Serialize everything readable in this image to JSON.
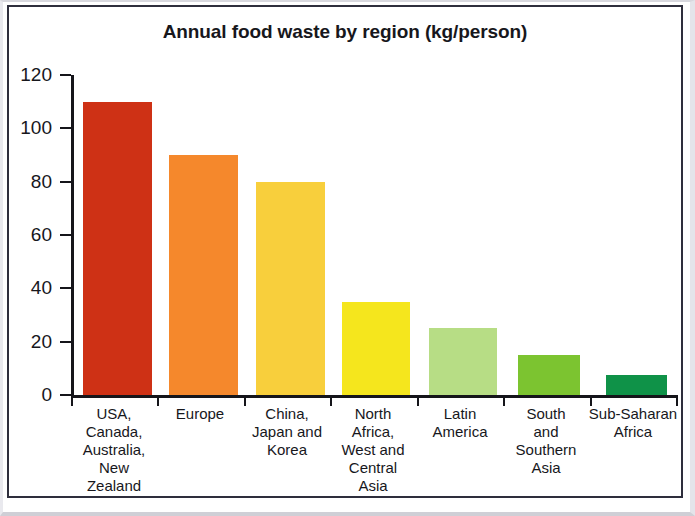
{
  "figure": {
    "title": "Annual food waste by region (kg/person)",
    "background": "#ffffff",
    "frame_color": "#2e2e3c",
    "axis_color": "#15151a",
    "text_color": "#17171c"
  },
  "chart_data": {
    "type": "bar",
    "title": "Annual food waste by region (kg/person)",
    "xlabel": "",
    "ylabel": "",
    "ylim": [
      0,
      120
    ],
    "yticks": [
      0,
      20,
      40,
      60,
      80,
      100,
      120
    ],
    "ytick_labels": [
      "0",
      "20",
      "40",
      "60",
      "80",
      "100",
      "120"
    ],
    "grid": false,
    "legend": "none",
    "categories": [
      "USA, Canada, Australia, New Zealand",
      "Europe",
      "China, Japan and Korea",
      "North Africa, West and Central Asia",
      "Latin America",
      "South and Southern Asia",
      "Sub-Saharan Africa"
    ],
    "category_lines": [
      [
        "USA,",
        "Canada,",
        "Australia,",
        "New",
        "Zealand"
      ],
      [
        "Europe"
      ],
      [
        "China,",
        "Japan and",
        "Korea"
      ],
      [
        "North",
        "Africa,",
        "West and",
        "Central",
        "Asia"
      ],
      [
        "Latin",
        "America"
      ],
      [
        "South",
        "and",
        "Southern",
        "Asia"
      ],
      [
        "Sub-Saharan",
        "Africa"
      ]
    ],
    "values": [
      110,
      90,
      80,
      35,
      25,
      15,
      7.5
    ],
    "units": "kg/person",
    "bar_colors": [
      "#ce3115",
      "#f5882c",
      "#f8cf3c",
      "#f5e61d",
      "#b7dd85",
      "#7cc430",
      "#0f9248"
    ]
  }
}
